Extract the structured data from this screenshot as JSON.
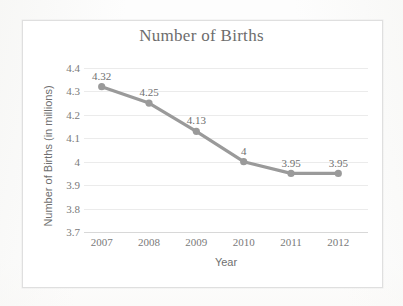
{
  "chart_data": {
    "type": "line",
    "title": "Number of Births",
    "xlabel": "Year",
    "ylabel": "Number of Births (in millions)",
    "categories": [
      "2007",
      "2008",
      "2009",
      "2010",
      "2011",
      "2012"
    ],
    "values": [
      4.32,
      4.25,
      4.13,
      4,
      3.95,
      3.95
    ],
    "point_labels": [
      "4.32",
      "4.25",
      "4.13",
      "4",
      "3.95",
      "3.95"
    ],
    "ylim": [
      3.7,
      4.4
    ],
    "yticks": [
      "4.4",
      "4.3",
      "4.2",
      "4.1",
      "4",
      "3.9",
      "3.8",
      "3.7"
    ],
    "ytick_values": [
      4.4,
      4.3,
      4.2,
      4.1,
      4.0,
      3.9,
      3.8,
      3.7
    ],
    "grid": "horizontal",
    "legend": "none",
    "series_color": "#9a9a9a",
    "marker": "circle",
    "gridline_color": "#ebebeb",
    "text_color": "#6f6f6f",
    "frame_color": "#dfdfdf"
  }
}
